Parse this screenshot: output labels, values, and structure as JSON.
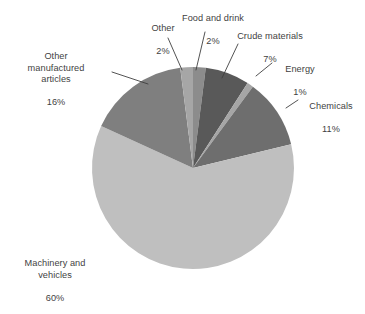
{
  "chart_data": {
    "type": "pie",
    "title": "",
    "subtitle": "",
    "xlabel": "",
    "ylabel": "",
    "legend_position": "none",
    "grid": false,
    "labels_outside": true,
    "value_suffix": "%",
    "categories": [
      "Machinery and vehicles",
      "Other manufactured articles",
      "Other",
      "Food and drink",
      "Crude materials",
      "Energy",
      "Chemicals"
    ],
    "values": [
      60,
      16,
      2,
      2,
      7,
      1,
      11
    ],
    "colors": [
      "#bfbfbf",
      "#7f7f7f",
      "#a6a6a6",
      "#8c8c8c",
      "#595959",
      "#a6a6a6",
      "#6e6e6e"
    ],
    "slices": [
      {
        "label": "Machinery and vehicles",
        "value": 60,
        "value_text": "60%",
        "color": "#bfbfbf"
      },
      {
        "label": "Other manufactured articles",
        "value": 16,
        "value_text": "16%",
        "color": "#7f7f7f"
      },
      {
        "label": "Other",
        "value": 2,
        "value_text": "2%",
        "color": "#a6a6a6"
      },
      {
        "label": "Food and drink",
        "value": 2,
        "value_text": "2%",
        "color": "#8c8c8c"
      },
      {
        "label": "Crude materials",
        "value": 7,
        "value_text": "7%",
        "color": "#595959"
      },
      {
        "label": "Energy",
        "value": 1,
        "value_text": "1%",
        "color": "#a6a6a6"
      },
      {
        "label": "Chemicals",
        "value": 11,
        "value_text": "11%",
        "color": "#6e6e6e"
      }
    ]
  },
  "labels": {
    "machinery": {
      "name": "Machinery and\nvehicles",
      "value": "60%"
    },
    "other_manufactured": {
      "name": "Other\nmanufactured\narticles",
      "value": "16%"
    },
    "other": {
      "name": "Other",
      "value": "2%"
    },
    "food_drink": {
      "name": "Food and drink",
      "value": "2%"
    },
    "crude_materials": {
      "name": "Crude materials",
      "value": "7%"
    },
    "energy": {
      "name": "Energy",
      "value": "1%"
    },
    "chemicals": {
      "name": "Chemicals",
      "value": "11%"
    }
  },
  "style": {
    "text_color": "#3f3f3f",
    "leader_line_color": "#3f3f3f",
    "background": "#ffffff"
  }
}
